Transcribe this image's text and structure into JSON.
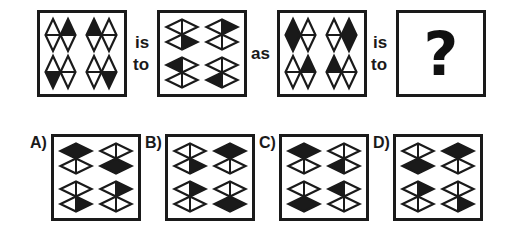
{
  "puzzle": {
    "connector_is": "is",
    "connector_to": "to",
    "connector_as": "as",
    "question_mark": "?"
  },
  "figures": [
    {
      "id": "figure-1",
      "orientation": "vertical",
      "rows": [
        [
          [
            "empty",
            "top"
          ],
          [
            "top",
            "empty"
          ]
        ],
        [
          [
            "bottom",
            "empty"
          ],
          [
            "empty",
            "bottom"
          ]
        ]
      ]
    },
    {
      "id": "figure-2",
      "orientation": "horizontal",
      "columns": [
        [
          [
            "empty",
            "right"
          ],
          [
            "left",
            "empty"
          ]
        ],
        [
          [
            "right",
            "empty"
          ],
          [
            "empty",
            "left"
          ]
        ]
      ]
    },
    {
      "id": "figure-3",
      "orientation": "vertical",
      "rows": [
        [
          [
            "full",
            "empty"
          ],
          [
            "empty",
            "full"
          ]
        ],
        [
          [
            "empty",
            "top"
          ],
          [
            "top",
            "empty"
          ]
        ]
      ]
    },
    {
      "id": "figure-4",
      "content": "?"
    }
  ],
  "options": [
    {
      "label": "A)",
      "orientation": "horizontal",
      "columns": [
        [
          [
            "full",
            "empty"
          ],
          [
            "empty",
            "right"
          ]
        ],
        [
          [
            "empty",
            "full"
          ],
          [
            "right",
            "empty"
          ]
        ]
      ]
    },
    {
      "label": "B)",
      "orientation": "horizontal",
      "columns": [
        [
          [
            "empty",
            "right"
          ],
          [
            "right",
            "empty"
          ]
        ],
        [
          [
            "full",
            "empty"
          ],
          [
            "empty",
            "full"
          ]
        ]
      ]
    },
    {
      "label": "C)",
      "orientation": "horizontal",
      "columns": [
        [
          [
            "full",
            "empty"
          ],
          [
            "empty",
            "full"
          ]
        ],
        [
          [
            "empty",
            "left"
          ],
          [
            "left",
            "empty"
          ]
        ]
      ]
    },
    {
      "label": "D)",
      "orientation": "horizontal",
      "columns": [
        [
          [
            "empty",
            "full"
          ],
          [
            "right",
            "empty"
          ]
        ],
        [
          [
            "full",
            "empty"
          ],
          [
            "empty",
            "right"
          ]
        ]
      ]
    }
  ],
  "colors": {
    "ink": "#1a1a1a",
    "background": "#ffffff"
  }
}
